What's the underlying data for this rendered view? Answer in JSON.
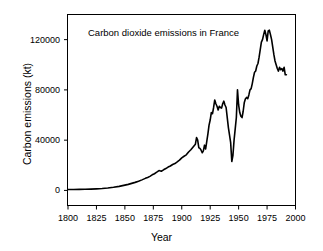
{
  "chart_data": {
    "type": "line",
    "title": "Carbon dioxide emissions in France",
    "xlabel": "Year",
    "ylabel": "Carbon emissions (kt)",
    "xlim": [
      1800,
      2000
    ],
    "ylim": [
      -12000,
      140000
    ],
    "xticks": [
      1800,
      1825,
      1850,
      1875,
      1900,
      1925,
      1950,
      1975,
      2000
    ],
    "xtick_labels": [
      "1800",
      "1825",
      "1850",
      "1875",
      "1900",
      "1925",
      "1950",
      "1975",
      "2000"
    ],
    "yticks": [
      0,
      40000,
      80000,
      120000
    ],
    "ytick_labels": [
      "0",
      "40000",
      "80000",
      "120000"
    ],
    "grid": false,
    "legend": null,
    "line_color": "#000000",
    "line_width": 1.6,
    "frame_color": "#000000",
    "series": [
      {
        "name": "Carbon dioxide emissions in France",
        "x": [
          1800,
          1805,
          1810,
          1815,
          1820,
          1825,
          1830,
          1835,
          1840,
          1845,
          1850,
          1853,
          1856,
          1859,
          1862,
          1865,
          1868,
          1870,
          1872,
          1874,
          1876,
          1878,
          1880,
          1882,
          1884,
          1886,
          1888,
          1890,
          1892,
          1894,
          1896,
          1898,
          1900,
          1902,
          1904,
          1906,
          1908,
          1910,
          1912,
          1913,
          1914,
          1915,
          1916,
          1917,
          1918,
          1919,
          1920,
          1921,
          1922,
          1923,
          1924,
          1925,
          1926,
          1927,
          1928,
          1929,
          1930,
          1931,
          1932,
          1933,
          1934,
          1935,
          1936,
          1937,
          1938,
          1939,
          1940,
          1941,
          1942,
          1943,
          1944,
          1945,
          1946,
          1947,
          1948,
          1949,
          1950,
          1951,
          1952,
          1953,
          1954,
          1955,
          1956,
          1957,
          1958,
          1959,
          1960,
          1961,
          1962,
          1963,
          1964,
          1965,
          1966,
          1967,
          1968,
          1969,
          1970,
          1971,
          1972,
          1973,
          1974,
          1975,
          1976,
          1977,
          1978,
          1979,
          1980,
          1981,
          1982,
          1983,
          1984,
          1985,
          1986,
          1987,
          1988,
          1989,
          1990,
          1991,
          1992
        ],
        "y": [
          700,
          750,
          820,
          900,
          1000,
          1200,
          1500,
          1900,
          2500,
          3200,
          4200,
          4800,
          5600,
          6400,
          7300,
          8400,
          9600,
          10300,
          11200,
          12400,
          13300,
          14500,
          15800,
          15300,
          16400,
          17400,
          18600,
          19400,
          20600,
          21400,
          22700,
          24100,
          25900,
          27200,
          28300,
          30600,
          32400,
          34600,
          36800,
          42000,
          40000,
          34000,
          33500,
          32000,
          30000,
          31500,
          36000,
          33000,
          39000,
          45000,
          52000,
          56000,
          62000,
          61000,
          66000,
          72000,
          69000,
          67000,
          64000,
          67000,
          66000,
          65500,
          69000,
          71000,
          68000,
          66000,
          58000,
          50000,
          44000,
          38000,
          23000,
          28000,
          40000,
          49000,
          58000,
          80000,
          68000,
          62000,
          59000,
          58000,
          63000,
          70000,
          73000,
          74000,
          73000,
          76000,
          80000,
          81000,
          85000,
          90000,
          94000,
          95000,
          99000,
          101000,
          106000,
          112000,
          118000,
          120000,
          124000,
          127500,
          124000,
          119000,
          127000,
          127500,
          124000,
          120000,
          114000,
          108000,
          103000,
          100000,
          97000,
          95000,
          98000,
          96000,
          97000,
          95000,
          98000,
          92000,
          92000
        ]
      }
    ]
  }
}
